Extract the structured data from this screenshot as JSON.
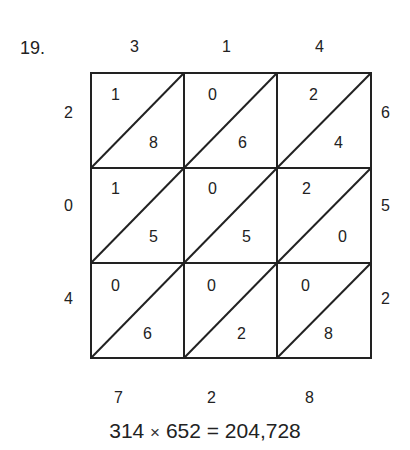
{
  "problem_number": "19.",
  "top_digits": [
    "3",
    "1",
    "4"
  ],
  "right_digits": [
    "6",
    "5",
    "2"
  ],
  "left_digits": [
    "2",
    "0",
    "4"
  ],
  "bottom_digits": [
    "7",
    "2",
    "8"
  ],
  "cells": [
    [
      {
        "tens": "1",
        "ones": "8"
      },
      {
        "tens": "0",
        "ones": "6"
      },
      {
        "tens": "2",
        "ones": "4"
      }
    ],
    [
      {
        "tens": "1",
        "ones": "5"
      },
      {
        "tens": "0",
        "ones": "5"
      },
      {
        "tens": "2",
        "ones": "0"
      }
    ],
    [
      {
        "tens": "0",
        "ones": "6"
      },
      {
        "tens": "0",
        "ones": "2"
      },
      {
        "tens": "0",
        "ones": "8"
      }
    ]
  ],
  "equation": {
    "left": "314",
    "times": "×",
    "right": "652 = 204,728"
  }
}
